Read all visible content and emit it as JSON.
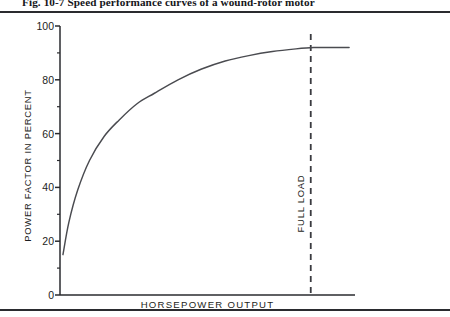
{
  "figure": {
    "caption": "Fig. 10-7  Speed performance curves of a wound-rotor motor"
  },
  "chart_data": {
    "type": "line",
    "title": "",
    "xlabel": "HORSEPOWER OUTPUT",
    "ylabel": "POWER FACTOR IN PERCENT",
    "xlim": [
      0,
      100
    ],
    "ylim": [
      0,
      100
    ],
    "grid": false,
    "legend": null,
    "y_ticks": [
      0,
      20,
      40,
      60,
      80,
      100
    ],
    "y_tick_labels": [
      "0",
      "20",
      "40",
      "60",
      "80",
      "100"
    ],
    "y_minor_ticks": [
      10,
      30,
      50,
      70,
      90
    ],
    "x_ticks": [],
    "x_tick_labels": [],
    "series": [
      {
        "name": "Power factor",
        "x": [
          1,
          3,
          6,
          10,
          15,
          20,
          26,
          32,
          40,
          48,
          56,
          64,
          72,
          80,
          86,
          92,
          98
        ],
        "values": [
          15,
          27,
          39,
          50,
          59,
          65,
          71,
          75,
          80,
          84,
          87,
          89,
          90.5,
          91.5,
          92,
          92,
          92
        ]
      }
    ],
    "annotations": [
      {
        "name": "full-load-marker",
        "label": "FULL LOAD",
        "type": "vertical-dashed-line",
        "x": 85
      }
    ],
    "colors": {
      "curve": "#4a4b50",
      "axis": "#2a2b2f",
      "marker": "#3a3b40",
      "text": "#1d1e22"
    }
  }
}
